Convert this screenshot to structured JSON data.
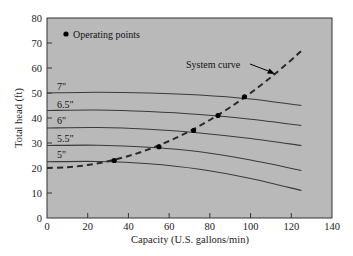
{
  "chart_data": {
    "type": "line",
    "title": "",
    "xlabel": "Capacity (U.S. gallons/min)",
    "ylabel": "Total head (ft)",
    "xlim": [
      0,
      140
    ],
    "ylim": [
      0,
      80
    ],
    "xticks": [
      0,
      20,
      40,
      60,
      80,
      100,
      120,
      140
    ],
    "yticks": [
      0,
      10,
      20,
      30,
      40,
      50,
      60,
      70,
      80
    ],
    "grid": false,
    "background": "#b9b9b9",
    "legend": {
      "position": "upper-left",
      "entries": [
        {
          "marker": "filled-circle",
          "label": "Operating points"
        }
      ]
    },
    "annotations": [
      {
        "text": "System curve",
        "arrow_to": [
          92,
          55
        ]
      }
    ],
    "series": [
      {
        "name": "7\"",
        "style": "solid",
        "x": [
          0,
          25,
          50,
          75,
          100,
          125
        ],
        "y": [
          50,
          50.3,
          50,
          49.2,
          47.6,
          45
        ]
      },
      {
        "name": "6.5\"",
        "style": "solid",
        "x": [
          0,
          25,
          50,
          75,
          100,
          125
        ],
        "y": [
          43,
          43.2,
          42.6,
          41.4,
          39.5,
          37
        ]
      },
      {
        "name": "6\"",
        "style": "solid",
        "x": [
          0,
          25,
          50,
          75,
          100,
          125
        ],
        "y": [
          36,
          36.2,
          35.5,
          34,
          31.8,
          29
        ]
      },
      {
        "name": "5.5\"",
        "style": "solid",
        "x": [
          0,
          25,
          50,
          75,
          100,
          125
        ],
        "y": [
          29,
          29.1,
          28.3,
          26.5,
          23.2,
          19
        ]
      },
      {
        "name": "5\"",
        "style": "solid",
        "x": [
          0,
          25,
          50,
          75,
          100,
          125
        ],
        "y": [
          22.5,
          22.6,
          21.7,
          19.5,
          15.8,
          11
        ]
      },
      {
        "name": "System curve",
        "style": "dashed",
        "x": [
          0,
          10,
          20,
          30,
          40,
          50,
          60,
          70,
          80,
          90,
          100,
          110,
          120,
          125
        ],
        "y": [
          20,
          20.3,
          21.2,
          22.7,
          24.8,
          27.5,
          30.8,
          34.7,
          39.2,
          44.3,
          50,
          56.3,
          63.2,
          66.9
        ]
      },
      {
        "name": "Operating points",
        "style": "markers",
        "x": [
          33,
          55,
          72,
          84,
          97
        ],
        "y": [
          23,
          28.5,
          35,
          41,
          48.5
        ]
      }
    ]
  },
  "labels": {
    "legend_text": "Operating points",
    "system_curve": "System curve",
    "curve_7": "7\"",
    "curve_65": "6.5\"",
    "curve_6": "6\"",
    "curve_55": "5.5\"",
    "curve_5": "5\""
  }
}
